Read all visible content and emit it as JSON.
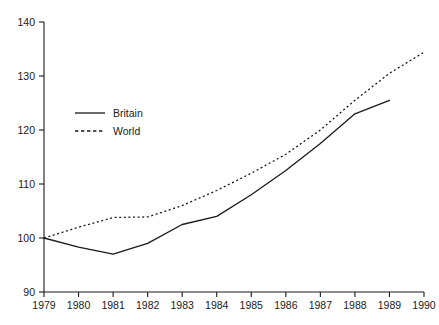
{
  "chart_data": {
    "type": "line",
    "title": "",
    "subtitle": "",
    "xlabel": "",
    "ylabel": "",
    "x": [
      1979,
      1980,
      1981,
      1982,
      1983,
      1984,
      1985,
      1986,
      1987,
      1988,
      1989,
      1990
    ],
    "categories": [
      "1979",
      "1980",
      "1981",
      "1982",
      "1983",
      "1984",
      "1985",
      "1986",
      "1987",
      "1988",
      "1989",
      "1990"
    ],
    "xlim": [
      1979,
      1990
    ],
    "ylim": [
      90,
      140
    ],
    "yticks": [
      90,
      100,
      110,
      120,
      130,
      140
    ],
    "ytick_labels": [
      "90",
      "100",
      "110",
      "120",
      "130",
      "140"
    ],
    "xticks": [
      1979,
      1980,
      1981,
      1982,
      1983,
      1984,
      1985,
      1986,
      1987,
      1988,
      1989,
      1990
    ],
    "xtick_labels": [
      "1979",
      "1980",
      "1981",
      "1982",
      "1983",
      "1984",
      "1985",
      "1986",
      "1987",
      "1988",
      "1989",
      "1990"
    ],
    "grid": false,
    "legend_position": "upper-left-inside",
    "series": [
      {
        "name": "Britain",
        "style": "solid",
        "color": "#1a1a1a",
        "x": [
          1979,
          1980,
          1981,
          1982,
          1983,
          1984,
          1985,
          1986,
          1987,
          1988,
          1989
        ],
        "values": [
          100.0,
          98.3,
          97.0,
          99.0,
          102.5,
          104.0,
          108.0,
          112.5,
          117.5,
          123.0,
          125.5
        ]
      },
      {
        "name": "World",
        "style": "dashed",
        "color": "#1a1a1a",
        "x": [
          1979,
          1980,
          1981,
          1982,
          1983,
          1984,
          1985,
          1986,
          1987,
          1988,
          1989,
          1990
        ],
        "values": [
          100.0,
          102.0,
          103.8,
          103.9,
          106.0,
          108.8,
          112.0,
          115.5,
          120.0,
          125.5,
          130.5,
          134.4
        ]
      }
    ]
  },
  "legend": {
    "entries": [
      {
        "label": "Britain",
        "style": "solid"
      },
      {
        "label": "World",
        "style": "dashed"
      }
    ]
  },
  "axes": {
    "y_axis_name": "index-axis",
    "x_axis_name": "year-axis"
  }
}
